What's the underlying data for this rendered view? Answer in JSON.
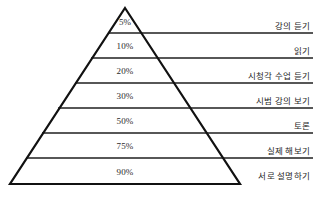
{
  "figure": {
    "background_color": "#ffffff",
    "line_color": "#1f1f1f",
    "outline_color": "#111111",
    "text_color": "#2b2b2b"
  },
  "chart_data": {
    "type": "pyramid",
    "subtitle": "",
    "xlabel": "",
    "ylabel": "",
    "value_unit": "%",
    "categories": [
      "강의 듣기",
      "읽기",
      "시청각 수업 듣기",
      "시범 강의 보기",
      "토론",
      "실제 해보기",
      "서로 설명하기"
    ],
    "values": [
      5,
      10,
      20,
      30,
      50,
      75,
      90
    ],
    "value_labels": [
      "5%",
      "10%",
      "20%",
      "30%",
      "50%",
      "75%",
      "90%"
    ],
    "legend": [],
    "grid": false,
    "annotations": []
  },
  "pyramid": {
    "apex": {
      "x": 125,
      "y": 8
    },
    "base_left": {
      "x": 10,
      "y": 184
    },
    "base_right": {
      "x": 240,
      "y": 184
    },
    "rows": [
      {
        "value_label": "5%",
        "label": "강의 듣기",
        "pct_x": 125,
        "pct_y": 22,
        "line_y": 33,
        "line_x1": 108,
        "line_x2": 313,
        "label_x": 310,
        "label_y": 31
      },
      {
        "value_label": "10%",
        "label": "읽기",
        "pct_x": 125,
        "pct_y": 46,
        "line_y": 58,
        "line_x1": 91,
        "line_x2": 313,
        "label_x": 310,
        "label_y": 56
      },
      {
        "value_label": "20%",
        "label": "시청각 수업 듣기",
        "pct_x": 125,
        "pct_y": 71,
        "line_y": 83,
        "line_x1": 75,
        "line_x2": 313,
        "label_x": 310,
        "label_y": 81
      },
      {
        "value_label": "30%",
        "label": "시범 강의 보기",
        "pct_x": 125,
        "pct_y": 96,
        "line_y": 108,
        "line_x1": 58,
        "line_x2": 313,
        "label_x": 310,
        "label_y": 106
      },
      {
        "value_label": "50%",
        "label": "토론",
        "pct_x": 125,
        "pct_y": 121,
        "line_y": 133,
        "line_x1": 42,
        "line_x2": 313,
        "label_x": 310,
        "label_y": 131
      },
      {
        "value_label": "75%",
        "label": "실제 해보기",
        "pct_x": 125,
        "pct_y": 146,
        "line_y": 158,
        "line_x1": 26,
        "line_x2": 313,
        "label_x": 310,
        "label_y": 156
      },
      {
        "value_label": "90%",
        "label": "서로 설명하기",
        "pct_x": 125,
        "pct_y": 172,
        "line_y": null,
        "line_x1": null,
        "line_x2": null,
        "label_x": 310,
        "label_y": 181
      }
    ]
  }
}
